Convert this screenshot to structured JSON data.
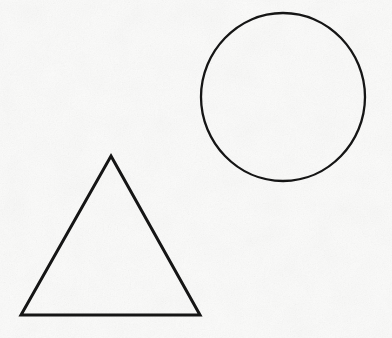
{
  "document": {
    "title": "Geometric Shapes Drawing",
    "kind": "line-drawing",
    "width": 392,
    "height": 338,
    "background_color": "#fbfbfa",
    "ink_color": "#151515",
    "medium": "scanned paper with light grain texture"
  },
  "shapes": [
    {
      "id": "circle",
      "name": "circle",
      "label": "Circle",
      "stroke_color": "#151515",
      "stroke_width": 2.3,
      "fill": "none",
      "center_x": 283,
      "center_y": 97,
      "radius_x": 82,
      "radius_y": 84,
      "bounds": {
        "left": 201,
        "top": 13,
        "right": 365,
        "bottom": 181
      },
      "path": "M 201 97 C 201 51.7 237.7 13 283 13 C 328.3 13 365 51.7 365 97 C 365 142.3 328.3 181 283 181 C 237.7 181 201 142.3 201 97 Z"
    },
    {
      "id": "triangle",
      "name": "triangle",
      "label": "Triangle",
      "stroke_color": "#151515",
      "stroke_width": 3.0,
      "fill": "none",
      "apex_x": 111,
      "apex_y": 156,
      "base_left_x": 21,
      "base_left_y": 315,
      "base_right_x": 200,
      "base_right_y": 315,
      "bounds": {
        "left": 21,
        "top": 156,
        "right": 200,
        "bottom": 315
      },
      "points": "111,156 200,315 21,315"
    }
  ],
  "texture": {
    "base_color": "#fbfbfa",
    "grain_color": "#e8e8e6",
    "opacity": 0.55
  }
}
